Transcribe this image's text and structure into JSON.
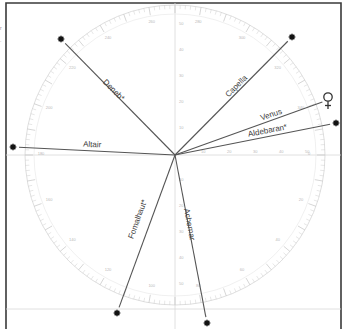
{
  "diagram": {
    "type": "star-direction-protractor",
    "center": {
      "x": 175,
      "y": 155
    },
    "radius": 150,
    "colors": {
      "frame": "#3a3a3a",
      "rays": "#555555",
      "labels": "#3c3c3c",
      "scale": "#cfcfcf",
      "stars": "#111111"
    },
    "objects": [
      {
        "name": "Deneb*",
        "kind": "star",
        "x": 61,
        "y": 39,
        "label_x": 112,
        "label_y": 92,
        "label_angle": 45
      },
      {
        "name": "Capella",
        "kind": "star",
        "x": 292,
        "y": 37,
        "label_x": 238,
        "label_y": 88,
        "label_angle": -45
      },
      {
        "name": "Venus",
        "kind": "planet",
        "x": 328,
        "y": 100,
        "label_x": 272,
        "label_y": 117,
        "label_angle": -19
      },
      {
        "name": "Aldebaran*",
        "kind": "star",
        "x": 336,
        "y": 123,
        "label_x": 268,
        "label_y": 133,
        "label_angle": -11
      },
      {
        "name": "Altair",
        "kind": "star",
        "x": 13,
        "y": 147,
        "label_x": 92,
        "label_y": 147,
        "label_angle": 3
      },
      {
        "name": "Fomalhaut*",
        "kind": "star",
        "x": 117,
        "y": 313,
        "label_x": 140,
        "label_y": 220,
        "label_angle": -70
      },
      {
        "name": "Achernar",
        "kind": "star",
        "x": 207,
        "y": 323,
        "label_x": 187,
        "label_y": 225,
        "label_angle": 79
      }
    ],
    "scale_labels": [
      "10",
      "20",
      "30",
      "40",
      "50"
    ]
  }
}
